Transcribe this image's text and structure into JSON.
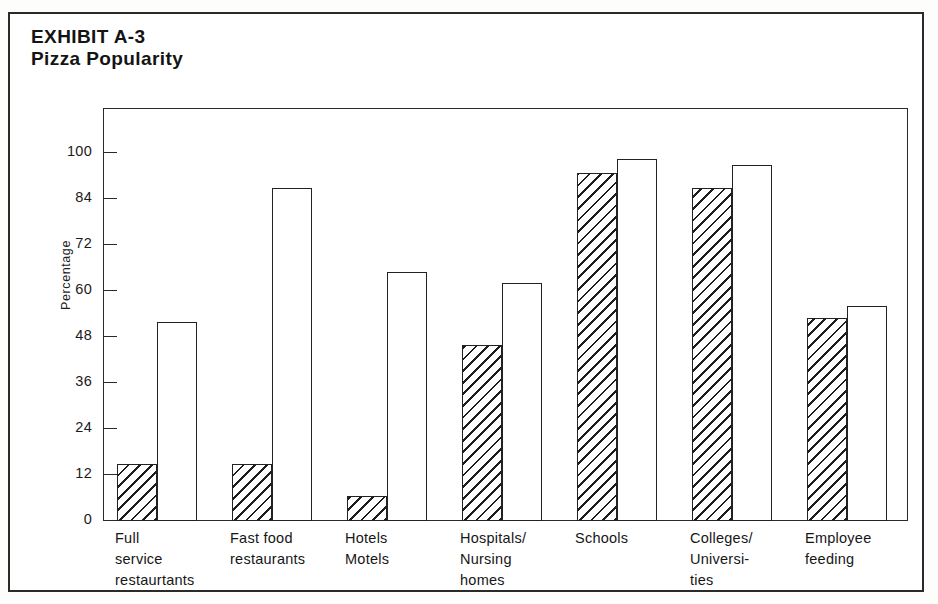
{
  "exhibit": {
    "title_line1": "EXHIBIT A-3",
    "title_line2": "Pizza Popularity"
  },
  "chart_data": {
    "type": "bar",
    "title": "Pizza Popularity",
    "subtitle": "EXHIBIT A-3",
    "xlabel": "",
    "ylabel": "Percentage",
    "ylim": [
      0,
      100
    ],
    "grid": false,
    "legend": "none",
    "axis_note": "Tick marks are evenly spaced in pixels although the 84-to-100 interval spans 16 units while all other intervals span 12 units.",
    "ytick_values": [
      0,
      12,
      24,
      36,
      48,
      60,
      72,
      84,
      100
    ],
    "ytick_labels": [
      "0",
      "12",
      "24",
      "36",
      "48",
      "60",
      "72",
      "84",
      "100"
    ],
    "categories": [
      "Full\nservice\nrestaurtants",
      "Fast food\nrestaurants",
      "Hotels\nMotels",
      "Hospitals/\nNursing\nhomes",
      "Schools",
      "Colleges/\nUniversi-\nties",
      "Employee\nfeeding"
    ],
    "series": [
      {
        "name": "hatched",
        "style": "diagonal-hatch",
        "values": [
          15,
          15,
          6.5,
          46,
          93,
          88,
          53
        ]
      },
      {
        "name": "open",
        "style": "outline-white",
        "values": [
          52,
          88,
          65,
          62,
          98,
          96,
          56
        ]
      }
    ]
  },
  "colors": {
    "ink": "#222222",
    "frame": "#2a2a2a",
    "paper": "#ffffff"
  }
}
